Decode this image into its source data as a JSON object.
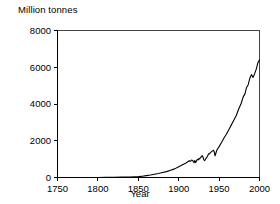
{
  "chart_data": {
    "type": "line",
    "title": "",
    "ylabel": "Million tonnes",
    "xlabel": "Year",
    "xlim": [
      1750,
      2000
    ],
    "ylim": [
      0,
      8000
    ],
    "xticks": [
      1750,
      1800,
      1850,
      1900,
      1950,
      2000
    ],
    "xtick_labels": [
      "1750",
      "1800",
      "1850",
      "1900",
      "1950",
      "2000"
    ],
    "yticks": [
      0,
      2000,
      4000,
      6000,
      8000
    ],
    "ytick_labels": [
      "0",
      "2000",
      "4000",
      "6000",
      "8000"
    ],
    "grid": false,
    "legend": false,
    "series": [
      {
        "name": "Production",
        "color": "#000000",
        "x": [
          1750,
          1760,
          1770,
          1780,
          1790,
          1800,
          1810,
          1820,
          1830,
          1840,
          1850,
          1855,
          1860,
          1865,
          1870,
          1875,
          1880,
          1885,
          1890,
          1895,
          1900,
          1903,
          1906,
          1909,
          1912,
          1913,
          1914,
          1915,
          1916,
          1917,
          1918,
          1919,
          1920,
          1921,
          1922,
          1923,
          1924,
          1925,
          1926,
          1927,
          1928,
          1929,
          1930,
          1931,
          1932,
          1933,
          1934,
          1935,
          1936,
          1937,
          1938,
          1939,
          1940,
          1941,
          1942,
          1943,
          1944,
          1945,
          1946,
          1947,
          1948,
          1949,
          1950,
          1953,
          1956,
          1959,
          1962,
          1965,
          1968,
          1971,
          1974,
          1977,
          1980,
          1982,
          1984,
          1986,
          1988,
          1990,
          1992,
          1994,
          1996,
          1998,
          2000
        ],
        "y": [
          0,
          0,
          0,
          0,
          0,
          0,
          5,
          10,
          18,
          30,
          45,
          70,
          100,
          135,
          175,
          215,
          270,
          320,
          400,
          470,
          590,
          650,
          720,
          790,
          880,
          920,
          880,
          900,
          950,
          930,
          880,
          800,
          930,
          820,
          900,
          980,
          960,
          1030,
          1010,
          1100,
          1120,
          1190,
          1120,
          980,
          920,
          980,
          1060,
          1110,
          1200,
          1290,
          1280,
          1340,
          1380,
          1420,
          1450,
          1480,
          1400,
          1180,
          1320,
          1460,
          1560,
          1600,
          1680,
          1900,
          2150,
          2350,
          2600,
          2850,
          3100,
          3350,
          3700,
          4000,
          4400,
          4550,
          4900,
          5050,
          5400,
          5600,
          5450,
          5650,
          5900,
          6250,
          6400
        ]
      }
    ]
  },
  "axes": {
    "ylabel_text": "Million tonnes",
    "xlabel_text": "Year"
  }
}
